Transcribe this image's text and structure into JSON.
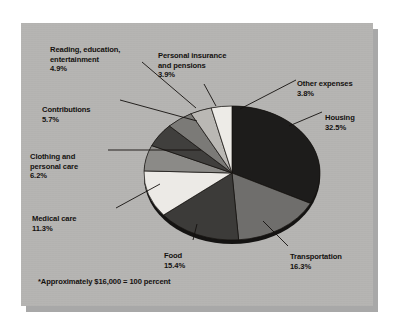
{
  "figure": {
    "footnote": "*Approximately $16,000 = 100 percent",
    "panel_color": "#b6b5b3",
    "shadow_color": "#a8a8a8",
    "text_color": "#14110f"
  },
  "chart_data": {
    "type": "pie",
    "title": "",
    "subtitle": "",
    "xlabel": "",
    "ylabel": "",
    "legend_position": "callout-labels",
    "grid": false,
    "total_note": "*Approximately $16,000 = 100 percent",
    "units": "percent",
    "categories": [
      "Housing",
      "Transportation",
      "Food",
      "Medical care",
      "Clothing and personal care",
      "Contributions",
      "Reading, education, entertainment",
      "Personal insurance and pensions",
      "Other expenses"
    ],
    "values": [
      32.5,
      16.3,
      15.4,
      11.3,
      6.2,
      5.7,
      4.9,
      3.9,
      3.8
    ],
    "slices": [
      {
        "label": "Housing",
        "value": 32.5,
        "value_text": "32.5%",
        "color": "#1d1c1b"
      },
      {
        "label": "Transportation",
        "value": 16.3,
        "value_text": "16.3%",
        "color": "#6f6e6c"
      },
      {
        "label": "Food",
        "value": 15.4,
        "value_text": "15.4%",
        "color": "#3c3b39"
      },
      {
        "label": "Medical care",
        "value": 11.3,
        "value_text": "11.3%",
        "color": "#eceae6"
      },
      {
        "label": "Clothing and personal care",
        "value": 6.2,
        "value_text": "6.2%",
        "color": "#8b8a87"
      },
      {
        "label": "Contributions",
        "value": 5.7,
        "value_text": "5.7%",
        "color": "#403f3d"
      },
      {
        "label": "Reading, education, entertainment",
        "value": 4.9,
        "value_text": "4.9%",
        "color": "#7b7a77"
      },
      {
        "label": "Personal insurance and pensions",
        "value": 3.9,
        "value_text": "3.9%",
        "color": "#bab8b4"
      },
      {
        "label": "Other expenses",
        "value": 3.8,
        "value_text": "3.8%",
        "color": "#edebe7"
      }
    ]
  },
  "labels": {
    "reading": {
      "name": "Reading, education,\nentertainment",
      "pct": "4.9%"
    },
    "personal": {
      "name": "Personal insurance\nand pensions",
      "pct": "3.9%"
    },
    "other": {
      "name": "Other expenses",
      "pct": "3.8%"
    },
    "housing": {
      "name": "Housing",
      "pct": "32.5%"
    },
    "contributions": {
      "name": "Contributions",
      "pct": "5.7%"
    },
    "clothing": {
      "name": "Clothing and\npersonal care",
      "pct": "6.2%"
    },
    "medical": {
      "name": "Medical care",
      "pct": "11.3%"
    },
    "food": {
      "name": "Food",
      "pct": "15.4%"
    },
    "transportation": {
      "name": "Transportation",
      "pct": "16.3%"
    }
  }
}
